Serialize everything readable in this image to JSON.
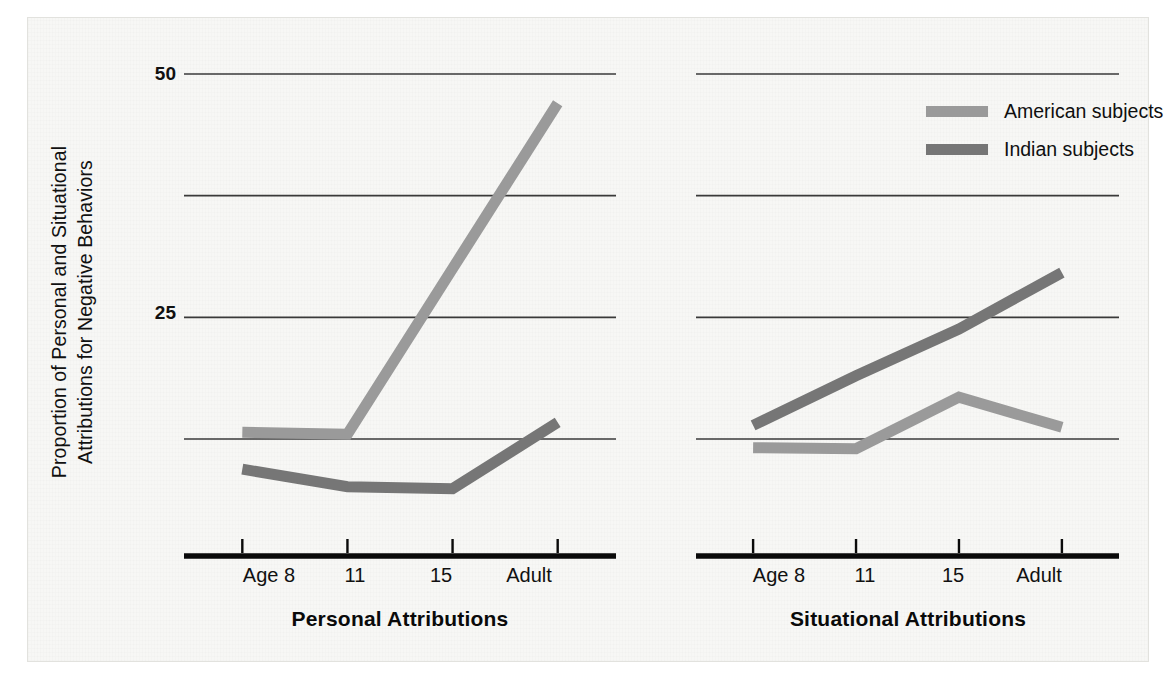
{
  "figure": {
    "y_axis_title_line1": "Proportion of Personal and Situational",
    "y_axis_title_line2": "Attributions for Negative Behaviors",
    "legend": [
      {
        "label": "American subjects",
        "color": "#9a9a9a",
        "key": "american"
      },
      {
        "label": "Indian subjects",
        "color": "#767676",
        "key": "indian"
      }
    ]
  },
  "chart_data": [
    {
      "type": "line",
      "title": "Personal Attributions",
      "xlabel": "Personal Attributions",
      "ylabel": "Proportion of Personal and Situational Attributions for Negative Behaviors",
      "categories": [
        "Age 8",
        "11",
        "15",
        "Adult"
      ],
      "tick_labels": [
        "Age 8",
        "11",
        "15",
        "Adult"
      ],
      "ylim": [
        0,
        54
      ],
      "yticks": [
        12.5,
        25,
        37.5,
        50
      ],
      "ytick_labels": [
        "",
        "25",
        "",
        "50"
      ],
      "grid": true,
      "legend_position": "top-right-outside",
      "series": [
        {
          "name": "American subjects",
          "color": "#9a9a9a",
          "values": [
            13.2,
            13.0,
            30.0,
            47.0
          ]
        },
        {
          "name": "Indian subjects",
          "color": "#767676",
          "values": [
            9.4,
            7.6,
            7.4,
            14.2
          ]
        }
      ]
    },
    {
      "type": "line",
      "title": "Situational Attributions",
      "xlabel": "Situational Attributions",
      "ylabel": "Proportion of Personal and Situational Attributions for Negative Behaviors",
      "categories": [
        "Age 8",
        "11",
        "15",
        "Adult"
      ],
      "tick_labels": [
        "Age 8",
        "11",
        "15",
        "Adult"
      ],
      "ylim": [
        0,
        54
      ],
      "yticks": [
        12.5,
        25,
        37.5,
        50
      ],
      "ytick_labels": [
        "",
        "25",
        "",
        "50"
      ],
      "grid": true,
      "legend_position": "top-right-outside",
      "series": [
        {
          "name": "American subjects",
          "color": "#9a9a9a",
          "values": [
            11.6,
            11.5,
            16.8,
            13.7
          ]
        },
        {
          "name": "Indian subjects",
          "color": "#767676",
          "values": [
            13.9,
            19.0,
            23.8,
            29.6
          ]
        }
      ]
    }
  ],
  "panels": [
    {
      "name": "personal-attributions",
      "title": "Personal Attributions",
      "xticks": [
        "Age 8",
        "11",
        "15",
        "Adult"
      ],
      "yticks": [
        {
          "value": 50,
          "label": "50"
        },
        {
          "value": 37.5,
          "label": ""
        },
        {
          "value": 25,
          "label": "25"
        },
        {
          "value": 12.5,
          "label": ""
        }
      ]
    },
    {
      "name": "situational-attributions",
      "title": "Situational Attributions",
      "xticks": [
        "Age 8",
        "11",
        "15",
        "Adult"
      ],
      "yticks": [
        {
          "value": 50,
          "label": ""
        },
        {
          "value": 37.5,
          "label": ""
        },
        {
          "value": 25,
          "label": ""
        },
        {
          "value": 12.5,
          "label": ""
        }
      ]
    }
  ]
}
